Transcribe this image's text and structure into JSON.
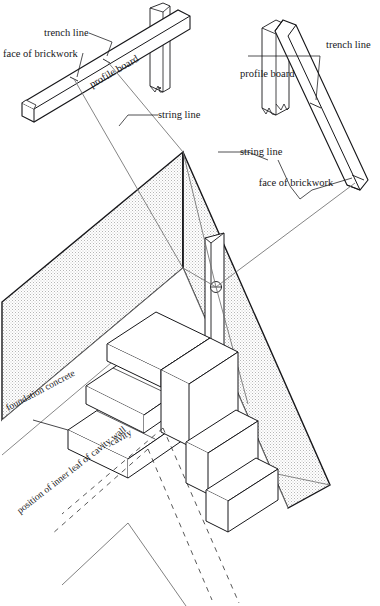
{
  "figure": {
    "background": "#ffffff",
    "ink": "#17171a",
    "hatch_fill": "#d9d9d9",
    "thin_line": "#555555",
    "dash_line": "#3a3a3a"
  },
  "labels": {
    "trench_line_left": "trench line",
    "face_of_brickwork_left": "face of brickwork",
    "profile_board_left": "profile board",
    "string_line_left": "string line",
    "trench_line_right": "trench line",
    "profile_board_right": "profile board",
    "string_line_right": "string line",
    "face_of_brickwork_right": "face of brickwork",
    "foundation_concrete": "foundation concrete",
    "cavity": "cavity",
    "inner_leaf": "position of inner leaf of cavity wall"
  },
  "parts": {
    "profile_board_left_name": "profile-board-left",
    "profile_board_right_name": "profile-board-right",
    "trench_name": "excavated-trench",
    "foundation_name": "foundation-concrete-slab",
    "brick_corner_name": "brick-corner-courses",
    "gauge_board_name": "vertical-gauge-board",
    "nail_name": "string-line-nail"
  },
  "geometry": {
    "trench_apex": [
      183,
      152
    ],
    "nail_center": [
      216,
      287
    ],
    "brick_course_count": 3
  }
}
